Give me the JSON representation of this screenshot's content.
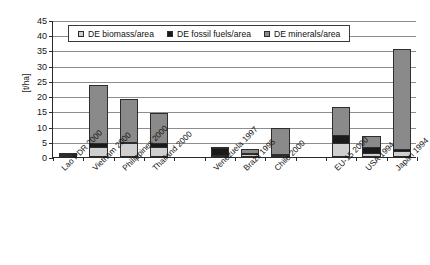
{
  "chart_data": {
    "type": "bar",
    "subtype": "stacked-bar",
    "title": "",
    "subtitle": "",
    "xlabel": "",
    "ylabel": "[t/ha]",
    "ylim": [
      0,
      45
    ],
    "ytick_step": 5,
    "yticks": [
      0,
      5,
      10,
      15,
      20,
      25,
      30,
      35,
      40,
      45
    ],
    "ytick_labels": [
      "0",
      "5",
      "10",
      "15",
      "20",
      "25",
      "30",
      "35",
      "40",
      "45"
    ],
    "grid": true,
    "grid_axis": "y",
    "legend_position": "top-inside",
    "categories": [
      "Lao PDR 2000",
      "Vietnam 2000",
      "Philippines 2000",
      "Thailand 2000",
      "Venezuela 1997",
      "Brazil 1995",
      "Chile 2000",
      "EU-15 2000",
      "USA 1994",
      "Japan 1994"
    ],
    "series": [
      {
        "name": "DE biomass/area",
        "color": "#cfcfcf",
        "values": [
          0.3,
          3.4,
          4.5,
          3.3,
          0.3,
          0.9,
          0.3,
          4.6,
          1.4,
          2.0
        ]
      },
      {
        "name": "DE fossil fuels/area",
        "color": "#1a1a1a",
        "values": [
          0.4,
          1.1,
          0.6,
          1.2,
          2.2,
          0.1,
          0.4,
          2.5,
          1.8,
          0.8
        ]
      },
      {
        "name": "DE minerals/area",
        "color": "#8a8a8a",
        "values": [
          0.1,
          19.0,
          14.0,
          10.0,
          0.2,
          1.5,
          8.5,
          9.4,
          3.7,
          32.8
        ]
      }
    ],
    "totals": [
      0.8,
      23.5,
      19.1,
      14.5,
      2.7,
      2.5,
      9.2,
      16.5,
      6.9,
      35.6
    ]
  },
  "legend": {
    "items": [
      {
        "label": "DE biomass/area",
        "color": "#cfcfcf"
      },
      {
        "label": "DE fossil fuels/area",
        "color": "#1a1a1a"
      },
      {
        "label": "DE minerals/area",
        "color": "#8a8a8a"
      }
    ]
  },
  "axis": {
    "y_title": "[t/ha]"
  }
}
